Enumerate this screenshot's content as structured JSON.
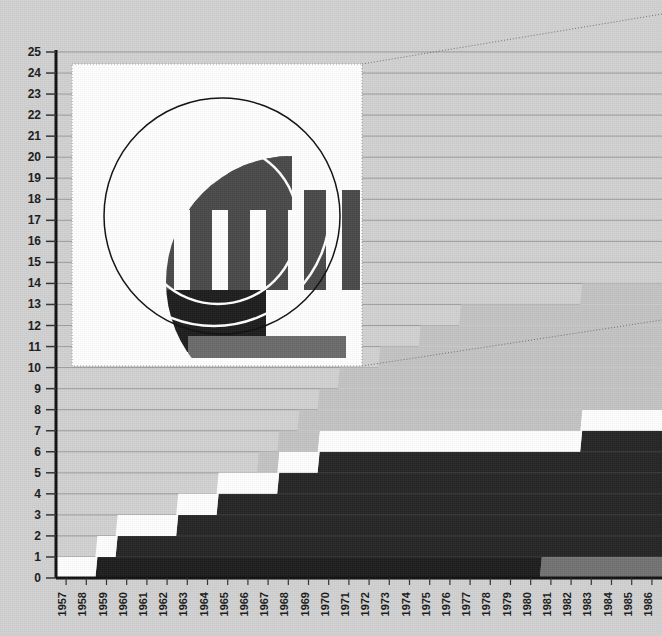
{
  "figure": {
    "background_color": "#d2d2d2",
    "plot": {
      "x0": 56,
      "x1": 662,
      "y_top": 52,
      "y_bottom": 578,
      "axis_color": "#111111",
      "gridline_color": "#8a8a8a"
    }
  },
  "chart_data": {
    "type": "area",
    "title": "",
    "subtitle": "",
    "xlabel": "",
    "ylabel": "",
    "grid": true,
    "legend_position": "none",
    "stacking": "stacked-step",
    "ylim": [
      0,
      25
    ],
    "ytick_values": [
      0,
      1,
      2,
      3,
      4,
      5,
      6,
      7,
      8,
      9,
      10,
      11,
      12,
      13,
      14,
      15,
      16,
      17,
      18,
      19,
      20,
      21,
      22,
      23,
      24,
      25
    ],
    "ytick_labels": [
      "0",
      "1",
      "2",
      "3",
      "4",
      "5",
      "6",
      "7",
      "8",
      "9",
      "10",
      "11",
      "12",
      "13",
      "14",
      "15",
      "16",
      "17",
      "18",
      "19",
      "20",
      "21",
      "22",
      "23",
      "24",
      "25"
    ],
    "x": [
      1957,
      1958,
      1959,
      1960,
      1961,
      1962,
      1963,
      1964,
      1965,
      1966,
      1967,
      1968,
      1969,
      1970,
      1971,
      1972,
      1973,
      1974,
      1975,
      1976,
      1977,
      1978,
      1979,
      1980,
      1981,
      1982,
      1983,
      1984,
      1985,
      1986
    ],
    "xtick_labels": [
      "1957",
      "1958",
      "1959",
      "1960",
      "1961",
      "1962",
      "1963",
      "1964",
      "1965",
      "1966",
      "1967",
      "1968",
      "1969",
      "1970",
      "1971",
      "1972",
      "1973",
      "1974",
      "1975",
      "1976",
      "1977",
      "1978",
      "1979",
      "1980",
      "1981",
      "1982",
      "1983",
      "1984",
      "1985",
      "1986"
    ],
    "series": [
      {
        "name": "band-1-base-grey",
        "color": "#737373",
        "values": [
          0,
          0,
          0,
          0,
          0,
          0,
          0,
          0,
          0,
          0,
          0,
          0,
          0,
          0,
          0,
          0,
          0,
          0,
          0,
          0,
          0,
          0,
          0,
          0,
          1,
          1,
          1,
          1,
          1,
          1
        ]
      },
      {
        "name": "band-2-dark",
        "color": "#1e1e1e",
        "values": [
          0,
          0,
          1,
          1,
          1,
          1,
          1,
          1,
          1,
          1,
          1,
          1,
          1,
          1,
          1,
          1,
          1,
          1,
          1,
          1,
          1,
          1,
          1,
          1,
          0,
          0,
          0,
          0,
          0,
          0
        ]
      },
      {
        "name": "band-3-white-gap",
        "color": "#ffffff",
        "values": [
          0,
          0,
          0,
          0,
          0,
          0,
          0,
          0,
          0,
          0,
          0,
          0,
          0,
          0,
          0,
          0,
          0,
          0,
          0,
          0,
          0,
          0,
          0,
          0,
          0,
          0,
          0,
          0,
          0,
          0
        ]
      },
      {
        "name": "band-4-dark-main",
        "color": "#262626",
        "values": [
          0,
          0,
          0,
          1,
          1,
          1,
          2,
          2,
          3,
          3,
          3,
          4,
          4,
          5,
          5,
          5,
          5,
          5,
          5,
          5,
          5,
          5,
          5,
          5,
          5,
          5,
          6,
          6,
          6,
          6
        ]
      },
      {
        "name": "band-5-white",
        "color": "#ffffff",
        "values": [
          1,
          1,
          1,
          1,
          1,
          1,
          1,
          1,
          1,
          1,
          1,
          1,
          1,
          1,
          1,
          1,
          1,
          1,
          1,
          1,
          1,
          1,
          1,
          1,
          1,
          1,
          1,
          1,
          1,
          1
        ]
      },
      {
        "name": "band-6-light-grey-top",
        "color": "#c4c4c4",
        "values": [
          0,
          0,
          0,
          0,
          0,
          0,
          0,
          0,
          0,
          0,
          1,
          1,
          2,
          2,
          3,
          3,
          4,
          4,
          5,
          5,
          6,
          6,
          6,
          6,
          6,
          6,
          6,
          6,
          6,
          6
        ]
      }
    ],
    "total_top": [
      1,
      1,
      2,
      3,
      3,
      3,
      4,
      4,
      5,
      5,
      6,
      7,
      8,
      9,
      10,
      10,
      11,
      11,
      12,
      12,
      13,
      13,
      13,
      13,
      13,
      13,
      14,
      14,
      14,
      14
    ]
  },
  "inset": {
    "name": "magnified-detail-inset",
    "x": 72,
    "y": 64,
    "width": 290,
    "height": 302,
    "background_color": "#ffffff",
    "border_style": "dotted",
    "border_color": "#9a9a9a",
    "callout_style": "dotted-leader-lines",
    "content_description": "magnified circular detail with vertical bars",
    "circle_stroke_color": "#111111",
    "bar_color": "#4a4a4a",
    "bar_dark_color": "#1e1e1e",
    "bars": [
      {
        "x": 38,
        "y": 130,
        "w": 22,
        "h": 92,
        "color": "#4a4a4a"
      },
      {
        "x": 76,
        "y": 122,
        "w": 22,
        "h": 100,
        "color": "#4a4a4a"
      },
      {
        "x": 114,
        "y": 26,
        "w": 22,
        "h": 196,
        "color": "#4a4a4a"
      },
      {
        "x": 152,
        "y": 26,
        "w": 22,
        "h": 196,
        "color": "#4a4a4a"
      },
      {
        "x": 190,
        "y": 26,
        "w": 22,
        "h": 196,
        "color": "#4a4a4a"
      },
      {
        "x": 228,
        "y": 122,
        "w": 22,
        "h": 100,
        "color": "#4a4a4a"
      },
      {
        "x": 266,
        "y": 122,
        "w": 18,
        "h": 100,
        "color": "#4a4a4a"
      }
    ]
  },
  "icons": {
    "zoom_region": "magnifier-inset-icon"
  }
}
